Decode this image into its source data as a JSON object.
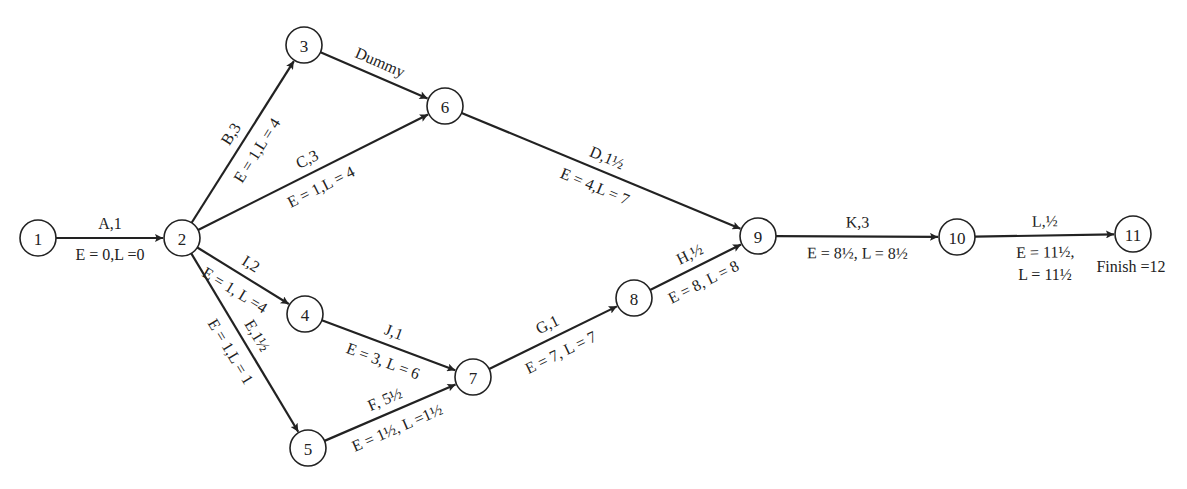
{
  "nodes": [
    {
      "id": "1",
      "x": 38,
      "y": 238
    },
    {
      "id": "2",
      "x": 182,
      "y": 238
    },
    {
      "id": "3",
      "x": 304,
      "y": 45
    },
    {
      "id": "4",
      "x": 305,
      "y": 314
    },
    {
      "id": "5",
      "x": 308,
      "y": 448
    },
    {
      "id": "6",
      "x": 445,
      "y": 106
    },
    {
      "id": "7",
      "x": 473,
      "y": 377
    },
    {
      "id": "8",
      "x": 634,
      "y": 298
    },
    {
      "id": "9",
      "x": 758,
      "y": 236
    },
    {
      "id": "10",
      "x": 957,
      "y": 237
    },
    {
      "id": "11",
      "x": 1133,
      "y": 234
    }
  ],
  "edges": [
    {
      "from": "1",
      "to": "2",
      "activity": "A,1",
      "times": "E = 0,L =0"
    },
    {
      "from": "2",
      "to": "3",
      "activity": "B,3",
      "times": "E = 1,L = 4"
    },
    {
      "from": "2",
      "to": "6",
      "activity": "C,3",
      "times": "E = 1,L = 4"
    },
    {
      "from": "3",
      "to": "6",
      "activity": "Dummy",
      "times": ""
    },
    {
      "from": "2",
      "to": "4",
      "activity": "I,2",
      "times": "E = 1, L =4"
    },
    {
      "from": "2",
      "to": "5",
      "activity": "E,1½",
      "times": "E = 1,L = 1"
    },
    {
      "from": "4",
      "to": "7",
      "activity": "J,1",
      "times": "E = 3, L = 6"
    },
    {
      "from": "5",
      "to": "7",
      "activity": "F, 5½",
      "times": "E = 1½, L =1½"
    },
    {
      "from": "6",
      "to": "9",
      "activity": "D,1½",
      "times": "E = 4,L = 7"
    },
    {
      "from": "7",
      "to": "8",
      "activity": "G,1",
      "times": "E = 7, L = 7"
    },
    {
      "from": "8",
      "to": "9",
      "activity": "H,½",
      "times": "E = 8, L = 8"
    },
    {
      "from": "9",
      "to": "10",
      "activity": "K,3",
      "times": "E = 8½, L = 8½"
    },
    {
      "from": "10",
      "to": "11",
      "activity": "L,½",
      "times": "E = 11½,",
      "times2": "L = 11½"
    }
  ],
  "finish_label": "Finish =12"
}
